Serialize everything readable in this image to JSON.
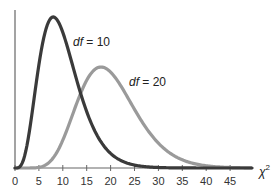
{
  "chart_data": {
    "type": "line",
    "title": "",
    "xlabel": "χ²",
    "ylabel": "",
    "xlim": [
      0,
      50
    ],
    "x_ticks": [
      0,
      5,
      10,
      15,
      20,
      25,
      30,
      35,
      40,
      45
    ],
    "x_tick_labels": [
      "0",
      "5",
      "10",
      "15",
      "20",
      "25",
      "30",
      "35",
      "40",
      "45"
    ],
    "grid": false,
    "legend": "none (inline annotations)",
    "series": [
      {
        "name": "df = 10",
        "df": 10,
        "color": "#3a3a3a",
        "mode": 8
      },
      {
        "name": "df = 20",
        "df": 20,
        "color": "#9a9a9a",
        "mode": 18
      }
    ],
    "annotations": [
      {
        "text_italic": "df",
        "text_rest": " = 10",
        "near_series": "df = 10"
      },
      {
        "text_italic": "df",
        "text_rest": " = 20",
        "near_series": "df = 20"
      }
    ]
  },
  "labels": {
    "ann1_italic": "df",
    "ann1_rest": " = 10",
    "ann2_italic": "df",
    "ann2_rest": " = 20",
    "xlabel_base": "χ",
    "xlabel_sup": "2"
  }
}
